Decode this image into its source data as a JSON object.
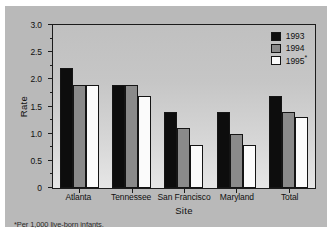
{
  "chart_data": {
    "type": "bar",
    "title": "",
    "xlabel": "Site",
    "ylabel": "Rate",
    "categories": [
      "Atlanta",
      "Tennessee",
      "San Francisco",
      "Maryland",
      "Total"
    ],
    "series": [
      {
        "name": "1993",
        "values": [
          2.2,
          1.9,
          1.4,
          1.4,
          1.7
        ],
        "color": "#0d0d0d"
      },
      {
        "name": "1994",
        "values": [
          1.9,
          1.9,
          1.1,
          1.0,
          1.4
        ],
        "color": "#8a8a8a"
      },
      {
        "name": "1995",
        "values": [
          1.9,
          1.7,
          0.8,
          0.8,
          1.3
        ],
        "color": "#ffffff"
      }
    ],
    "ylim": [
      0,
      3.0
    ],
    "ytick_labels": [
      "0",
      "0.5",
      "1.0",
      "1.5",
      "2.0",
      "2.5",
      "3.0"
    ],
    "ytick_values": [
      0,
      0.5,
      1.0,
      1.5,
      2.0,
      2.5,
      3.0
    ],
    "yminor_values": [
      0.25,
      0.75,
      1.25,
      1.75,
      2.25,
      2.75
    ],
    "grid": false,
    "legend_position": "top-right",
    "legend_entries": [
      {
        "label": "1993",
        "marker": "1993"
      },
      {
        "label": "1994",
        "marker": "1994"
      },
      {
        "label": "1995",
        "marker": "1995",
        "superscript": "*"
      }
    ],
    "footnote": "*Per 1,000 live-born infants.",
    "annotations": []
  },
  "legend": {
    "item0": "1993",
    "item1": "1994",
    "item2": "1995",
    "item2_sup": "*"
  },
  "axes": {
    "y_title": "Rate",
    "x_title": "Site",
    "y0": "0",
    "y1": "0.5",
    "y2": "1.0",
    "y3": "1.5",
    "y4": "2.0",
    "y5": "2.5",
    "y6": "3.0"
  },
  "categories": {
    "c0": "Atlanta",
    "c1": "Tennessee",
    "c2": "San Francisco",
    "c3": "Maryland",
    "c4": "Total"
  },
  "footnote": {
    "text": "*Per 1,000 live-born infants."
  }
}
